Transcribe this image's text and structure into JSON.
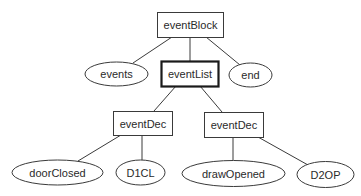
{
  "diagram": {
    "type": "tree",
    "colors": {
      "background": "#ffffff",
      "stroke": "#3a3a3a",
      "text": "#2a2a2a"
    },
    "nodes": {
      "eventBlock": {
        "label": "eventBlock",
        "shape": "rectangle"
      },
      "events": {
        "label": "events",
        "shape": "ellipse"
      },
      "eventList": {
        "label": "eventList",
        "shape": "rectangle",
        "emphasized": true
      },
      "end": {
        "label": "end",
        "shape": "ellipse"
      },
      "eventDec1": {
        "label": "eventDec",
        "shape": "rectangle"
      },
      "eventDec2": {
        "label": "eventDec",
        "shape": "rectangle"
      },
      "doorClosed": {
        "label": "doorClosed",
        "shape": "ellipse"
      },
      "D1CL": {
        "label": "D1CL",
        "shape": "ellipse"
      },
      "drawOpened": {
        "label": "drawOpened",
        "shape": "ellipse"
      },
      "D2OP": {
        "label": "D2OP",
        "shape": "ellipse"
      }
    },
    "edges": [
      [
        "eventBlock",
        "events"
      ],
      [
        "eventBlock",
        "eventList"
      ],
      [
        "eventBlock",
        "end"
      ],
      [
        "eventList",
        "eventDec1"
      ],
      [
        "eventList",
        "eventDec2"
      ],
      [
        "eventDec1",
        "doorClosed"
      ],
      [
        "eventDec1",
        "D1CL"
      ],
      [
        "eventDec2",
        "drawOpened"
      ],
      [
        "eventDec2",
        "D2OP"
      ]
    ]
  }
}
